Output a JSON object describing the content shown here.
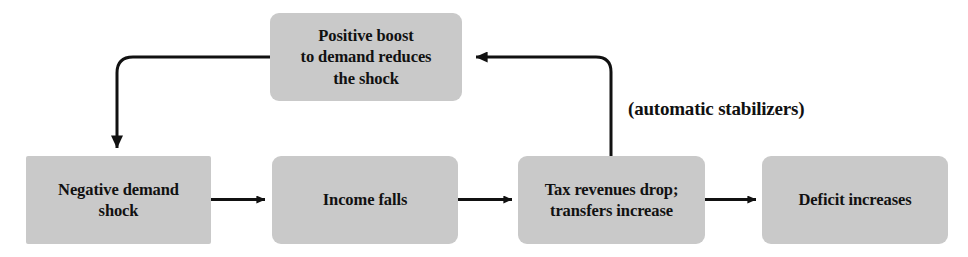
{
  "diagram": {
    "background_color": "#ffffff",
    "box_fill_color": "#c9c9c9",
    "line_color": "#111111",
    "text_color": "#111111",
    "nodes": [
      {
        "id": "positive-boost",
        "label": "Positive boost\nto demand reduces\nthe shock",
        "x": 270,
        "y": 13,
        "width": 192,
        "height": 88
      },
      {
        "id": "negative-demand-shock",
        "label": "Negative demand\nshock",
        "x": 26,
        "y": 156,
        "width": 185,
        "height": 88
      },
      {
        "id": "income-falls",
        "label": "Income falls",
        "x": 272,
        "y": 156,
        "width": 186,
        "height": 88
      },
      {
        "id": "tax-revenues-drop",
        "label": "Tax revenues drop;\ntransfers increase",
        "x": 518,
        "y": 156,
        "width": 187,
        "height": 88
      },
      {
        "id": "deficit-increases",
        "label": "Deficit increases",
        "x": 762,
        "y": 156,
        "width": 186,
        "height": 88
      }
    ],
    "annotations": [
      {
        "id": "automatic-stabilizers-note",
        "text": "(automatic stabilizers)",
        "x": 628,
        "y": 98
      }
    ],
    "edges": [
      {
        "id": "edge-shock-to-income",
        "from": "negative-demand-shock",
        "to": "income-falls",
        "kind": "straight-right"
      },
      {
        "id": "edge-income-to-tax",
        "from": "income-falls",
        "to": "tax-revenues-drop",
        "kind": "straight-right"
      },
      {
        "id": "edge-tax-to-deficit",
        "from": "tax-revenues-drop",
        "to": "deficit-increases",
        "kind": "straight-right"
      },
      {
        "id": "edge-tax-to-positive-boost",
        "from": "tax-revenues-drop",
        "to": "positive-boost",
        "kind": "up-then-left"
      },
      {
        "id": "edge-positive-boost-to-shock",
        "from": "positive-boost",
        "to": "negative-demand-shock",
        "kind": "left-then-down"
      }
    ]
  }
}
